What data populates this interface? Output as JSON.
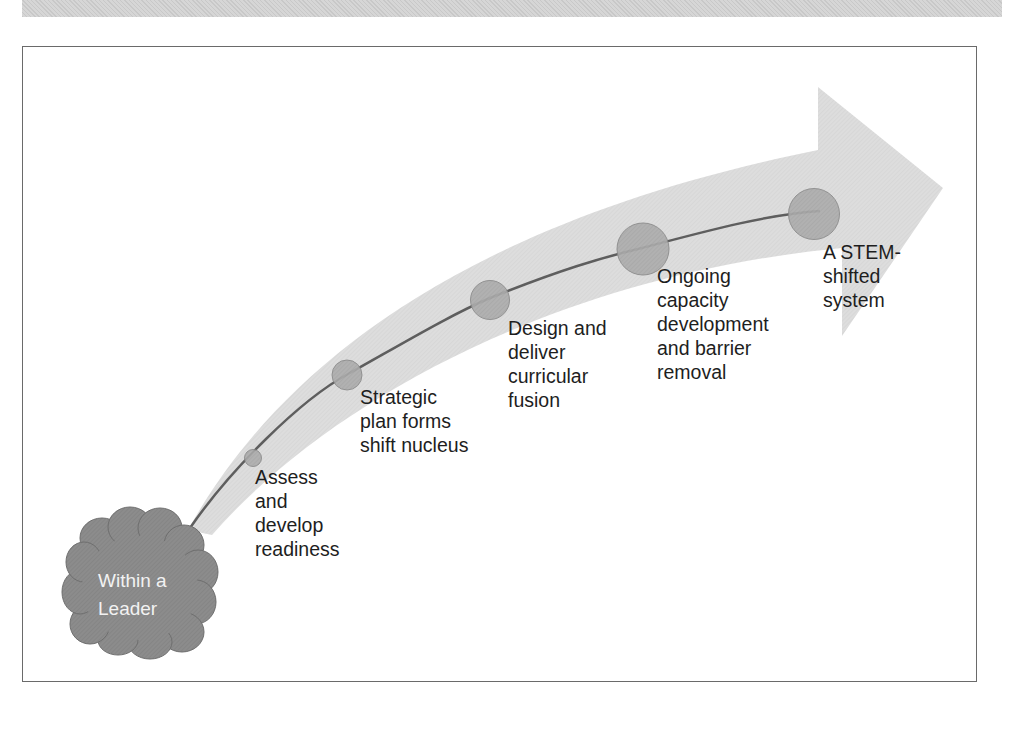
{
  "diagram": {
    "origin": {
      "label": "Within a\nLeader",
      "shape": "cloud",
      "fill": "#8a8a8a"
    },
    "path": {
      "arrow_fill": "#dcdcdc",
      "line_color": "#6a6a6a"
    },
    "stages": [
      {
        "id": "assess",
        "label": "Assess\nand\ndevelop\nreadiness",
        "circle_fill": "#a8a8a8"
      },
      {
        "id": "strategic-plan",
        "label": "Strategic\nplan forms\nshift nucleus",
        "circle_fill": "#a8a8a8"
      },
      {
        "id": "design-deliver",
        "label": "Design and\ndeliver\ncurricular\nfusion",
        "circle_fill": "#a8a8a8"
      },
      {
        "id": "ongoing-capacity",
        "label": "Ongoing\ncapacity\ndevelopment\nand barrier\nremoval",
        "circle_fill": "#a8a8a8"
      },
      {
        "id": "stem-shifted",
        "label": "A STEM-\nshifted\nsystem",
        "circle_fill": "#a8a8a8"
      }
    ]
  }
}
